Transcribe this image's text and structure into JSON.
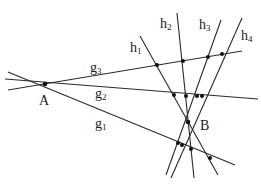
{
  "diagram": {
    "type": "projective-geometry-lines",
    "points": [
      {
        "id": "A",
        "label": "A",
        "x": 45,
        "y": 84,
        "label_x": 39,
        "label_y": 105
      },
      {
        "id": "B",
        "label": "B",
        "x": 188,
        "y": 122,
        "label_x": 200,
        "label_y": 130
      }
    ],
    "lines": [
      {
        "id": "g1",
        "base": "g",
        "sub": "1",
        "x1": 8,
        "y1": 72,
        "x2": 235,
        "y2": 165,
        "label_x": 95,
        "label_y": 128
      },
      {
        "id": "g2",
        "base": "g",
        "sub": "2",
        "x1": 5,
        "y1": 79,
        "x2": 258,
        "y2": 99,
        "label_x": 95,
        "label_y": 98
      },
      {
        "id": "g3",
        "base": "g",
        "sub": "3",
        "x1": 8,
        "y1": 90,
        "x2": 242,
        "y2": 51,
        "label_x": 90,
        "label_y": 72
      },
      {
        "id": "h1",
        "base": "h",
        "sub": "1",
        "x1": 140,
        "y1": 36,
        "x2": 218,
        "y2": 175,
        "label_x": 130,
        "label_y": 52
      },
      {
        "id": "h2",
        "base": "h",
        "sub": "2",
        "x1": 177,
        "y1": 13,
        "x2": 194,
        "y2": 178,
        "label_x": 160,
        "label_y": 28
      },
      {
        "id": "h3",
        "base": "h",
        "sub": "3",
        "x1": 221,
        "y1": 20,
        "x2": 166,
        "y2": 175,
        "label_x": 199,
        "label_y": 29
      },
      {
        "id": "h4",
        "base": "h",
        "sub": "4",
        "x1": 242,
        "y1": 18,
        "x2": 171,
        "y2": 178,
        "label_x": 241,
        "label_y": 40
      }
    ],
    "intersections": [
      {
        "x": 157,
        "y": 65
      },
      {
        "x": 183,
        "y": 61
      },
      {
        "x": 208,
        "y": 57
      },
      {
        "x": 222,
        "y": 54
      },
      {
        "x": 174,
        "y": 95
      },
      {
        "x": 186,
        "y": 96
      },
      {
        "x": 197,
        "y": 96
      },
      {
        "x": 202,
        "y": 96
      },
      {
        "x": 178,
        "y": 143
      },
      {
        "x": 182,
        "y": 145
      },
      {
        "x": 191,
        "y": 149
      },
      {
        "x": 210,
        "y": 158
      }
    ],
    "colors": {
      "line": "#2a2a2a",
      "point": "#111111",
      "background": "#ffffff"
    }
  }
}
